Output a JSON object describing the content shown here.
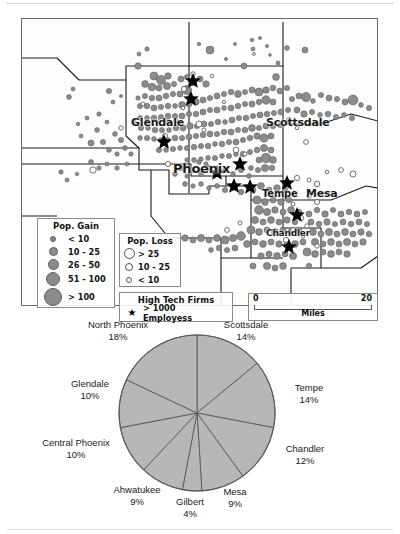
{
  "figure": {
    "map": {
      "title": "Phoenix metropolitan area population change and high tech firms",
      "city_labels": [
        {
          "name": "Glendale",
          "x": 131,
          "y": 106,
          "size": 11
        },
        {
          "name": "Phoenix",
          "x": 174,
          "y": 152,
          "size": 13
        },
        {
          "name": "Scottsdale",
          "x": 269,
          "y": 106,
          "size": 11
        },
        {
          "name": "Tempe",
          "x": 261,
          "y": 176,
          "size": 10
        },
        {
          "name": "Mesa",
          "x": 307,
          "y": 176,
          "size": 11
        },
        {
          "name": "Chandler",
          "x": 273,
          "y": 216,
          "size": 9
        }
      ],
      "legend_gain": {
        "title": "Pop. Gain",
        "rows": [
          {
            "label": "< 10",
            "size": 4
          },
          {
            "label": "10 - 25",
            "size": 7
          },
          {
            "label": "26 - 50",
            "size": 9
          },
          {
            "label": "51 - 100",
            "size": 12
          },
          {
            "label": "> 100",
            "size": 16
          }
        ]
      },
      "legend_loss": {
        "title": "Pop. Loss",
        "rows": [
          {
            "label": "> 25",
            "size": 9
          },
          {
            "label": "10 - 25",
            "size": 6
          },
          {
            "label": "< 10",
            "size": 4
          }
        ]
      },
      "legend_firms": {
        "title": "High Tech Firms",
        "row_label": "> 1000 Employess",
        "marker": "star-icon"
      },
      "scalebar": {
        "min": "0",
        "max": "20",
        "unit": "Miles"
      },
      "colors": {
        "gain_fill": "#8b8b8b",
        "gain_stroke": "#5f5f5f",
        "loss_fill": "#ffffff",
        "loss_stroke": "#4d4d4d",
        "firm_marker": "#000000",
        "boundary": "#1a1a1a",
        "frame": "#6b6b6b"
      }
    },
    "chart_data": {
      "type": "pie",
      "title": "",
      "categories": [
        "Scottsdale",
        "Tempe",
        "Chandler",
        "Mesa",
        "Gilbert",
        "Ahwatukee",
        "Central Phoenix",
        "Glendale",
        "North Phoenix"
      ],
      "values": [
        14,
        14,
        12,
        9,
        4,
        9,
        10,
        10,
        18
      ],
      "unit": "%",
      "legend_position": "outside-labels",
      "slice_fill": "#b7b7b7",
      "slice_stroke": "#5a5a5a",
      "labels": [
        {
          "name": "North Phoenix",
          "pct": "18%",
          "x": 72,
          "y": 1,
          "w": 92,
          "align": "center"
        },
        {
          "name": "Scottsdale",
          "pct": "14%",
          "x": 207,
          "y": 1,
          "w": 78,
          "align": "center"
        },
        {
          "name": "Tempe",
          "pct": "14%",
          "x": 279,
          "y": 64,
          "w": 56,
          "align": "left"
        },
        {
          "name": "Chandler",
          "pct": "12%",
          "x": 272,
          "y": 125,
          "w": 66,
          "align": "left"
        },
        {
          "name": "Mesa",
          "pct": "9%",
          "x": 214,
          "y": 168,
          "w": 42,
          "align": "center"
        },
        {
          "name": "Gilbert",
          "pct": "4%",
          "x": 167,
          "y": 178,
          "w": 46,
          "align": "center"
        },
        {
          "name": "Ahwatukee",
          "pct": "9%",
          "x": 104,
          "y": 166,
          "w": 66,
          "align": "center"
        },
        {
          "name": "Central Phoenix",
          "pct": "10%",
          "x": 33,
          "y": 119,
          "w": 86,
          "align": "center"
        },
        {
          "name": "Glendale",
          "pct": "10%",
          "x": 59,
          "y": 60,
          "w": 62,
          "align": "center"
        }
      ]
    }
  }
}
